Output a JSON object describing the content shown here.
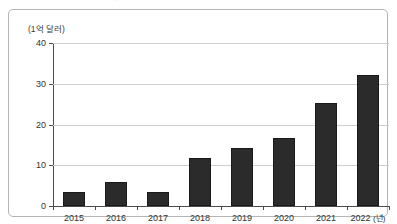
{
  "caption_strip": {
    "text": "ㅣ 글ㅣ 보ㅣ 방ㅣ 산ㅣ 시ㅣ 장ㅣ 규ㅣ 모ㅣ 추ㅣ 이ㅣ"
  },
  "chart_data": {
    "type": "bar",
    "title": "",
    "subtitle": "",
    "unit_label": "(1억 달러)",
    "xlabel": "(년)",
    "ylabel": "",
    "categories": [
      "2015",
      "2016",
      "2017",
      "2018",
      "2019",
      "2020",
      "2021",
      "2022"
    ],
    "values": [
      3.4,
      6.0,
      3.4,
      11.8,
      14.2,
      16.8,
      25.2,
      32.2
    ],
    "yticks": [
      0,
      10,
      20,
      30,
      40
    ],
    "ytick_labels": [
      "0",
      "10",
      "20",
      "30",
      "40"
    ],
    "ylim": [
      0,
      40
    ],
    "grid": true,
    "legend": "none",
    "bar_color": "#2b2b2b",
    "grid_color": "#cfcfcf",
    "axis_color": "#4a4a4a",
    "frame_color": "#b5b5b5"
  }
}
